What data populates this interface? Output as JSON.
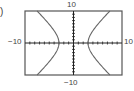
{
  "figure": {
    "part_label": ")"
  },
  "chart_data": {
    "type": "line",
    "title": "",
    "xlabel": "",
    "ylabel": "",
    "xlim": [
      -10,
      10
    ],
    "ylim": [
      -10,
      10
    ],
    "tick_labels": {
      "xmin": "−10",
      "xmax": "10",
      "ymin": "−10",
      "ymax": "10"
    },
    "grid": false,
    "tick_marks": "every 1 unit along both axes",
    "series": [
      {
        "name": "right branch",
        "equation_hint": "hyperbola x^2/a^2 - y^2/b^2 = 1, a≈3",
        "points": [
          [
            7.5,
            10
          ],
          [
            5.5,
            6
          ],
          [
            4,
            3
          ],
          [
            3,
            0
          ],
          [
            4,
            -3
          ],
          [
            5.5,
            -6
          ],
          [
            7.5,
            -10
          ]
        ]
      },
      {
        "name": "left branch",
        "points": [
          [
            -7.5,
            10
          ],
          [
            -5.5,
            6
          ],
          [
            -4,
            3
          ],
          [
            -3,
            0
          ],
          [
            -4,
            -3
          ],
          [
            -5.5,
            -6
          ],
          [
            -7.5,
            -10
          ]
        ]
      }
    ]
  }
}
